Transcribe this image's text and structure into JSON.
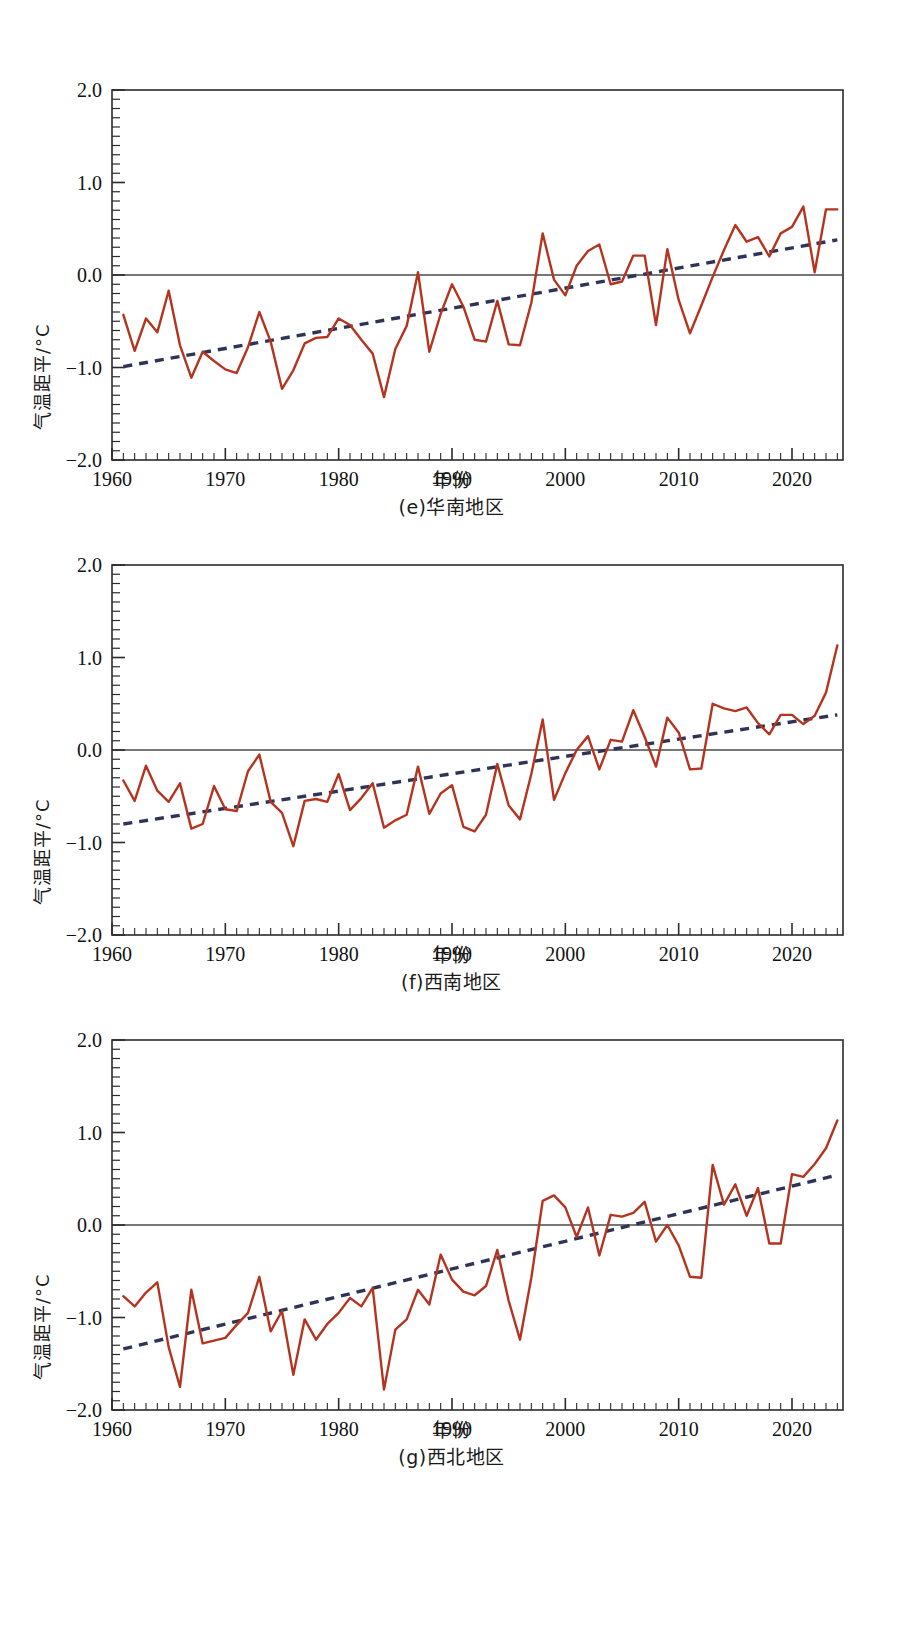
{
  "figure": {
    "axis_titles": {
      "y": "气温距平/°C",
      "x": "年份"
    },
    "y_ticks": [
      "2.0",
      "1.0",
      "0.0",
      "-1.0",
      "-2.0"
    ],
    "x_ticks": [
      "1960",
      "1970",
      "1980",
      "1990",
      "2000",
      "2010",
      "2020"
    ],
    "colors": {
      "series_line": "#B5341F",
      "trend_line": "#2E3457",
      "axis": "#2b2b2b",
      "zero_line": "#4a4a4a",
      "background": "#ffffff"
    }
  },
  "panels": [
    {
      "id": "e",
      "caption": "(e)华南地区"
    },
    {
      "id": "f",
      "caption": "(f)西南地区"
    },
    {
      "id": "g",
      "caption": "(g)西北地区"
    }
  ],
  "chart_data": [
    {
      "type": "line",
      "title": "(e)华南地区",
      "xlabel": "年份",
      "ylabel": "气温距平/°C",
      "xlim": [
        1960,
        2024
      ],
      "ylim": [
        -2.0,
        2.0
      ],
      "yticks": [
        -2.0,
        -1.0,
        0.0,
        1.0,
        2.0
      ],
      "xticks": [
        1960,
        1970,
        1980,
        1990,
        2000,
        2010,
        2020
      ],
      "minor_tick_step_x": 1,
      "minor_tick_step_y": 0.1,
      "grid": false,
      "legend": "none",
      "x": [
        1961,
        1962,
        1963,
        1964,
        1965,
        1966,
        1967,
        1968,
        1969,
        1970,
        1971,
        1972,
        1973,
        1974,
        1975,
        1976,
        1977,
        1978,
        1979,
        1980,
        1981,
        1982,
        1983,
        1984,
        1985,
        1986,
        1987,
        1988,
        1989,
        1990,
        1991,
        1992,
        1993,
        1994,
        1995,
        1996,
        1997,
        1998,
        1999,
        2000,
        2001,
        2002,
        2003,
        2004,
        2005,
        2006,
        2007,
        2008,
        2009,
        2010,
        2011,
        2012,
        2013,
        2014,
        2015,
        2016,
        2017,
        2018,
        2019,
        2020,
        2021,
        2022,
        2023,
        2024
      ],
      "series": [
        {
          "name": "气温距平",
          "values": [
            -0.43,
            -0.82,
            -0.47,
            -0.62,
            -0.17,
            -0.76,
            -1.11,
            -0.83,
            -0.93,
            -1.02,
            -1.06,
            -0.78,
            -0.4,
            -0.72,
            -1.23,
            -1.03,
            -0.74,
            -0.68,
            -0.67,
            -0.47,
            -0.54,
            -0.7,
            -0.85,
            -1.32,
            -0.8,
            -0.55,
            0.03,
            -0.83,
            -0.42,
            -0.1,
            -0.34,
            -0.7,
            -0.72,
            -0.28,
            -0.75,
            -0.76,
            -0.3,
            0.45,
            -0.05,
            -0.22,
            0.1,
            0.26,
            0.33,
            -0.1,
            -0.07,
            0.21,
            0.21,
            -0.54,
            0.28,
            -0.27,
            -0.63,
            -0.33,
            -0.02,
            0.27,
            0.54,
            0.36,
            0.41,
            0.2,
            0.45,
            0.52,
            0.74,
            0.03,
            0.71,
            0.71
          ]
        }
      ],
      "trend": {
        "name": "线性趋势",
        "style": "dashed",
        "start": [
          1961,
          -0.99
        ],
        "end": [
          2024,
          0.38
        ]
      }
    },
    {
      "type": "line",
      "title": "(f)西南地区",
      "xlabel": "年份",
      "ylabel": "气温距平/°C",
      "xlim": [
        1960,
        2024
      ],
      "ylim": [
        -2.0,
        2.0
      ],
      "yticks": [
        -2.0,
        -1.0,
        0.0,
        1.0,
        2.0
      ],
      "xticks": [
        1960,
        1970,
        1980,
        1990,
        2000,
        2010,
        2020
      ],
      "minor_tick_step_x": 1,
      "minor_tick_step_y": 0.1,
      "grid": false,
      "legend": "none",
      "x": [
        1961,
        1962,
        1963,
        1964,
        1965,
        1966,
        1967,
        1968,
        1969,
        1970,
        1971,
        1972,
        1973,
        1974,
        1975,
        1976,
        1977,
        1978,
        1979,
        1980,
        1981,
        1982,
        1983,
        1984,
        1985,
        1986,
        1987,
        1988,
        1989,
        1990,
        1991,
        1992,
        1993,
        1994,
        1995,
        1996,
        1997,
        1998,
        1999,
        2000,
        2001,
        2002,
        2003,
        2004,
        2005,
        2006,
        2007,
        2008,
        2009,
        2010,
        2011,
        2012,
        2013,
        2014,
        2015,
        2016,
        2017,
        2018,
        2019,
        2020,
        2021,
        2022,
        2023,
        2024
      ],
      "series": [
        {
          "name": "气温距平",
          "values": [
            -0.33,
            -0.55,
            -0.17,
            -0.44,
            -0.56,
            -0.36,
            -0.85,
            -0.8,
            -0.39,
            -0.64,
            -0.66,
            -0.23,
            -0.05,
            -0.56,
            -0.68,
            -1.04,
            -0.55,
            -0.53,
            -0.56,
            -0.26,
            -0.65,
            -0.52,
            -0.36,
            -0.84,
            -0.76,
            -0.7,
            -0.18,
            -0.69,
            -0.47,
            -0.38,
            -0.83,
            -0.88,
            -0.7,
            -0.15,
            -0.6,
            -0.75,
            -0.26,
            0.33,
            -0.54,
            -0.25,
            0.0,
            0.15,
            -0.21,
            0.11,
            0.09,
            0.43,
            0.14,
            -0.18,
            0.35,
            0.19,
            -0.21,
            -0.2,
            0.5,
            0.45,
            0.42,
            0.46,
            0.29,
            0.17,
            0.38,
            0.38,
            0.28,
            0.37,
            0.62,
            1.13
          ]
        }
      ],
      "trend": {
        "name": "线性趋势",
        "style": "dashed",
        "start": [
          1961,
          -0.8
        ],
        "end": [
          2024,
          0.38
        ]
      }
    },
    {
      "type": "line",
      "title": "(g)西北地区",
      "xlabel": "年份",
      "ylabel": "气温距平/°C",
      "xlim": [
        1960,
        2024
      ],
      "ylim": [
        -2.0,
        2.0
      ],
      "yticks": [
        -2.0,
        -1.0,
        0.0,
        1.0,
        2.0
      ],
      "xticks": [
        1960,
        1970,
        1980,
        1990,
        2000,
        2010,
        2020
      ],
      "minor_tick_step_x": 1,
      "minor_tick_step_y": 0.1,
      "grid": false,
      "legend": "none",
      "x": [
        1961,
        1962,
        1963,
        1964,
        1965,
        1966,
        1967,
        1968,
        1969,
        1970,
        1971,
        1972,
        1973,
        1974,
        1975,
        1976,
        1977,
        1978,
        1979,
        1980,
        1981,
        1982,
        1983,
        1984,
        1985,
        1986,
        1987,
        1988,
        1989,
        1990,
        1991,
        1992,
        1993,
        1994,
        1995,
        1996,
        1997,
        1998,
        1999,
        2000,
        2001,
        2002,
        2003,
        2004,
        2005,
        2006,
        2007,
        2008,
        2009,
        2010,
        2011,
        2012,
        2013,
        2014,
        2015,
        2016,
        2017,
        2018,
        2019,
        2020,
        2021,
        2022,
        2023,
        2024
      ],
      "series": [
        {
          "name": "气温距平",
          "values": [
            -0.77,
            -0.88,
            -0.73,
            -0.62,
            -1.32,
            -1.75,
            -0.7,
            -1.28,
            -1.25,
            -1.22,
            -1.08,
            -0.95,
            -0.56,
            -1.15,
            -0.93,
            -1.62,
            -1.02,
            -1.24,
            -1.07,
            -0.95,
            -0.79,
            -0.88,
            -0.68,
            -1.78,
            -1.13,
            -1.02,
            -0.7,
            -0.86,
            -0.32,
            -0.59,
            -0.72,
            -0.76,
            -0.66,
            -0.27,
            -0.82,
            -1.24,
            -0.57,
            0.26,
            0.32,
            0.19,
            -0.13,
            0.19,
            -0.33,
            0.11,
            0.09,
            0.13,
            0.25,
            -0.18,
            0.0,
            -0.22,
            -0.56,
            -0.57,
            0.65,
            0.22,
            0.44,
            0.1,
            0.4,
            -0.2,
            -0.2,
            0.55,
            0.52,
            0.66,
            0.83,
            1.13
          ]
        }
      ],
      "trend": {
        "name": "线性趋势",
        "style": "dashed",
        "start": [
          1961,
          -1.34
        ],
        "end": [
          2024,
          0.54
        ]
      }
    }
  ]
}
